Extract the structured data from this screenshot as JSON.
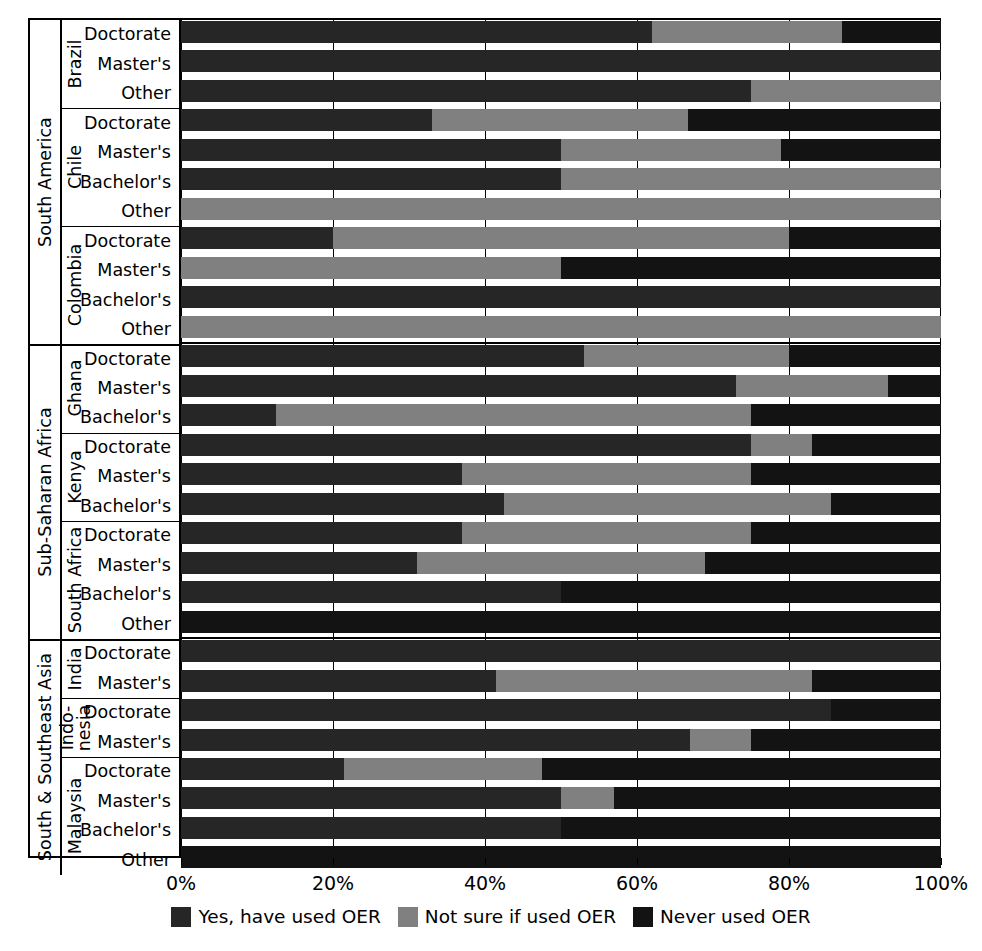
{
  "chart_data": {
    "type": "bar",
    "orientation": "horizontal",
    "stacked": true,
    "normalized_percent": true,
    "title": "",
    "subtitle": "",
    "xlabel": "",
    "ylabel": "",
    "xlim": [
      0,
      100
    ],
    "xticks": [
      0,
      20,
      40,
      60,
      80,
      100
    ],
    "xticklabels": [
      "0%",
      "20%",
      "40%",
      "60%",
      "80%",
      "100%"
    ],
    "grid": true,
    "grid_axis": "x",
    "legend_position": "bottom-center",
    "series": [
      {
        "name": "Yes, have used OER",
        "color": "#262626"
      },
      {
        "name": "Not sure if used OER",
        "color": "#808080"
      },
      {
        "name": "Never used OER",
        "color": "#131313"
      }
    ],
    "regions": [
      {
        "label": "South America",
        "countries": [
          {
            "label": "Brazil",
            "rows": [
              {
                "label": "Doctorate",
                "values": [
                  62,
                  25,
                  13
                ]
              },
              {
                "label": "Master's",
                "values": [
                  100,
                  0,
                  0
                ]
              },
              {
                "label": "Other",
                "values": [
                  75,
                  25,
                  0
                ]
              }
            ]
          },
          {
            "label": "Chile",
            "rows": [
              {
                "label": "Doctorate",
                "values": [
                  33,
                  33.7,
                  33.3
                ]
              },
              {
                "label": "Master's",
                "values": [
                  50,
                  29,
                  21
                ]
              },
              {
                "label": "Bachelor's",
                "values": [
                  50,
                  50,
                  0
                ]
              },
              {
                "label": "Other",
                "values": [
                  0,
                  100,
                  0
                ]
              }
            ]
          },
          {
            "label": "Colombia",
            "rows": [
              {
                "label": "Doctorate",
                "values": [
                  20,
                  60,
                  20
                ]
              },
              {
                "label": "Master's",
                "values": [
                  0,
                  50,
                  50
                ]
              },
              {
                "label": "Bachelor's",
                "values": [
                  100,
                  0,
                  0
                ]
              },
              {
                "label": "Other",
                "values": [
                  0,
                  100,
                  0
                ]
              }
            ]
          }
        ]
      },
      {
        "label": "Sub-Saharan Africa",
        "countries": [
          {
            "label": "Ghana",
            "rows": [
              {
                "label": "Doctorate",
                "values": [
                  53,
                  27,
                  20
                ]
              },
              {
                "label": "Master's",
                "values": [
                  73,
                  20,
                  7
                ]
              },
              {
                "label": "Bachelor's",
                "values": [
                  12.5,
                  62.5,
                  25
                ]
              }
            ]
          },
          {
            "label": "Kenya",
            "rows": [
              {
                "label": "Doctorate",
                "values": [
                  75,
                  8,
                  17
                ]
              },
              {
                "label": "Master's",
                "values": [
                  37,
                  38,
                  25
                ]
              },
              {
                "label": "Bachelor's",
                "values": [
                  42.5,
                  43,
                  14.5
                ]
              }
            ]
          },
          {
            "label": "South Africa",
            "rows": [
              {
                "label": "Doctorate",
                "values": [
                  37,
                  38,
                  25
                ]
              },
              {
                "label": "Master's",
                "values": [
                  31,
                  38,
                  31
                ]
              },
              {
                "label": "Bachelor's",
                "values": [
                  50,
                  0,
                  50
                ]
              },
              {
                "label": "Other",
                "values": [
                  0,
                  0,
                  100
                ]
              }
            ]
          }
        ]
      },
      {
        "label": "South & Southeast Asia",
        "countries": [
          {
            "label": "India",
            "rows": [
              {
                "label": "Doctorate",
                "values": [
                  100,
                  0,
                  0
                ]
              },
              {
                "label": "Master's",
                "values": [
                  41.5,
                  41.5,
                  17
                ]
              }
            ]
          },
          {
            "label": "Indo-\nnesia",
            "label_lines": [
              "Indo-",
              "nesia"
            ],
            "rows": [
              {
                "label": "Doctorate",
                "values": [
                  85.5,
                  0,
                  14.5
                ]
              },
              {
                "label": "Master's",
                "values": [
                  67,
                  8,
                  25
                ]
              }
            ]
          },
          {
            "label": "Malaysia",
            "rows": [
              {
                "label": "Doctorate",
                "values": [
                  21.5,
                  26,
                  52.5
                ]
              },
              {
                "label": "Master's",
                "values": [
                  50,
                  7,
                  43
                ]
              },
              {
                "label": "Bachelor's",
                "values": [
                  50,
                  0,
                  50
                ]
              },
              {
                "label": "Other",
                "values": [
                  0,
                  0,
                  100
                ]
              }
            ]
          }
        ]
      }
    ]
  },
  "legend": {
    "items": [
      {
        "label": "Yes, have used OER",
        "color": "#262626"
      },
      {
        "label": "Not sure if used OER",
        "color": "#808080"
      },
      {
        "label": "Never used OER",
        "color": "#131313"
      }
    ]
  },
  "axis": {
    "ticklabels": [
      "0%",
      "20%",
      "40%",
      "60%",
      "80%",
      "100%"
    ]
  }
}
